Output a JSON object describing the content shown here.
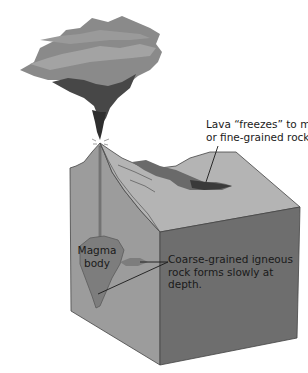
{
  "diagram": {
    "type": "volcano-cross-section",
    "labels": {
      "lava": {
        "line1": "Lava “freezes” to make glassy",
        "line2": "or fine-grained rock."
      },
      "magma": {
        "line1": "Magma",
        "line2": "body"
      },
      "coarse": {
        "line1": "Coarse-grained igneous",
        "line2": "rock forms slowly at",
        "line3": "depth."
      }
    },
    "colors": {
      "cloud_light": "#8a8a8a",
      "cloud_dark": "#3a3a3a",
      "block_top": "#b4b4b4",
      "block_left": "#9c9c9c",
      "block_front": "#6e6e6e",
      "magma": "#7d7d7d",
      "lava_flow": "#4a4a4a",
      "text": "#1a1a1a"
    }
  }
}
